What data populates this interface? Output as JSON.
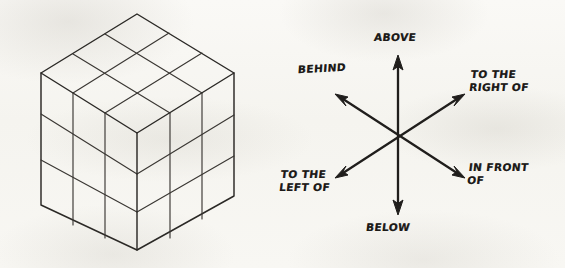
{
  "figure": {
    "background_color": "#f7f6f2",
    "ink_color": "#2b2926"
  },
  "cube": {
    "name": "3x3x3 isometric cube",
    "divisions": 3,
    "faces": [
      "top",
      "left",
      "right"
    ],
    "geometry": {
      "top_apex": [
        137,
        14
      ],
      "left_vertex": [
        41,
        73
      ],
      "right_vertex": [
        234,
        73
      ],
      "front_vertex": [
        137,
        133
      ],
      "left_bottom": [
        41,
        205
      ],
      "right_bottom": [
        234,
        196
      ],
      "bottom_apex": [
        137,
        250
      ]
    }
  },
  "axes": {
    "center": [
      398,
      135
    ],
    "directions": [
      {
        "id": "above",
        "label": "ABOVE",
        "lines": [
          "ABOVE"
        ],
        "tip": [
          398,
          58
        ],
        "angle_deg": 90
      },
      {
        "id": "below",
        "label": "BELOW",
        "lines": [
          "BELOW"
        ],
        "tip": [
          398,
          212
        ],
        "angle_deg": 270
      },
      {
        "id": "behind",
        "label": "BEHIND",
        "lines": [
          "BEHIND"
        ],
        "tip": [
          337,
          95
        ],
        "angle_deg": 145
      },
      {
        "id": "right-of",
        "label": "TO THE RIGHT OF",
        "lines": [
          "TO THE",
          "RIGHT OF"
        ],
        "tip": [
          462,
          95
        ],
        "angle_deg": 35
      },
      {
        "id": "left-of",
        "label": "TO THE LEFT OF",
        "lines": [
          "TO THE",
          "LEFT OF"
        ],
        "tip": [
          337,
          177
        ],
        "angle_deg": 215
      },
      {
        "id": "in-front",
        "label": "IN FRONT OF",
        "lines": [
          "IN FRONT",
          "OF"
        ],
        "tip": [
          462,
          177
        ],
        "angle_deg": 325
      }
    ]
  },
  "labels": {
    "above": "ABOVE",
    "behind": "BEHIND",
    "right_of_line1": "TO THE",
    "right_of_line2": "RIGHT OF",
    "in_front_line1": "IN FRONT",
    "in_front_line2": "OF",
    "left_of_line1": "TO THE",
    "left_of_line2": "LEFT OF",
    "below": "BELOW"
  }
}
